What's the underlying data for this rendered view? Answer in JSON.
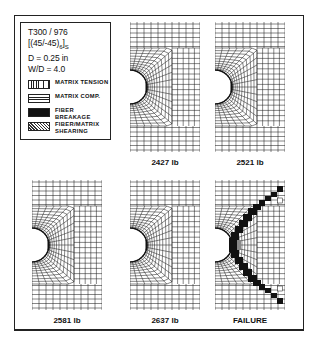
{
  "legend": {
    "material": "T300 / 976",
    "layup_main": "[(45/-45)",
    "layup_sub1": "6",
    "layup_end": "]",
    "layup_sub2": "S",
    "diameter": "D = 0.25 in",
    "width_ratio": "W/D = 4.0",
    "items": [
      {
        "label": "MATRIX TENSION",
        "pattern": "vertical-lines"
      },
      {
        "label": "MATRIX COMP.",
        "pattern": "horizontal-lines"
      },
      {
        "label": "FIBER BREAKAGE",
        "pattern": "solid-black"
      },
      {
        "label": "FIBER/MATRIX SHEARING",
        "pattern": "diagonal-hatch"
      }
    ]
  },
  "panels": [
    {
      "label": "2427 lb",
      "x": 130,
      "y": 22,
      "damage": "tension-small"
    },
    {
      "label": "2521 lb",
      "x": 215,
      "y": 22,
      "damage": "tension-small"
    },
    {
      "label": "2581 lb",
      "x": 32,
      "y": 180,
      "damage": "tension-small"
    },
    {
      "label": "2637 lb",
      "x": 130,
      "y": 180,
      "damage": "tension-small"
    },
    {
      "label": "FAILURE",
      "x": 215,
      "y": 180,
      "damage": "failure"
    }
  ],
  "colors": {
    "ink": "#111111",
    "paper": "#ffffff"
  }
}
